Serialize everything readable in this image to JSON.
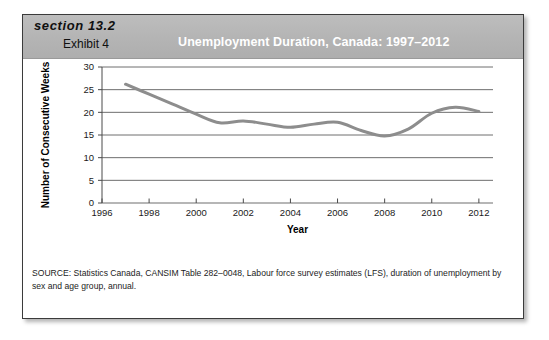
{
  "header": {
    "section_label": "section 13.2",
    "exhibit_label": "Exhibit 4",
    "title": "Unemployment Duration, Canada: 1997–2012",
    "band_color": "#b4b4b4",
    "title_color": "#ffffff"
  },
  "source_note": "SOURCE: Statistics Canada, CANSIM Table 282–0048, Labour force survey estimates (LFS), duration of unemployment by sex and age group, annual.",
  "chart_data": {
    "type": "line",
    "title": "Unemployment Duration, Canada: 1997–2012",
    "xlabel": "Year",
    "ylabel": "Number of Consecutive Weeks",
    "xlim": [
      1996,
      2012.6
    ],
    "ylim": [
      0,
      30
    ],
    "xticks": [
      1996,
      1998,
      2000,
      2002,
      2004,
      2006,
      2008,
      2010,
      2012
    ],
    "xtick_labels": [
      "1996",
      "1998",
      "2000",
      "2002",
      "2004",
      "2006",
      "2008",
      "2010",
      "2012"
    ],
    "yticks": [
      0,
      5,
      10,
      15,
      20,
      25,
      30
    ],
    "ytick_labels": [
      "0",
      "5",
      "10",
      "15",
      "20",
      "25",
      "30"
    ],
    "grid": "horizontal",
    "grid_color": "#6e6e6e",
    "line_color": "#8d8d8d",
    "line_width": 3,
    "legend": "none",
    "series": [
      {
        "name": "Average duration of unemployment (weeks)",
        "x": [
          1997,
          1998,
          1999,
          2000,
          2001,
          2002,
          2003,
          2004,
          2005,
          2006,
          2007,
          2008,
          2009,
          2010,
          2011,
          2012
        ],
        "values": [
          26.2,
          24.0,
          21.8,
          19.6,
          17.7,
          18.1,
          17.4,
          16.7,
          17.4,
          17.8,
          16.0,
          14.8,
          16.3,
          19.8,
          21.1,
          20.2
        ]
      }
    ]
  }
}
